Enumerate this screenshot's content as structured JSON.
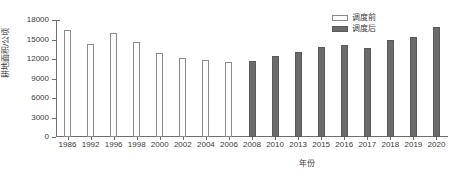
{
  "chart_data": {
    "type": "bar",
    "title": "",
    "xlabel": "年份",
    "ylabel": "耕地面积/公顷",
    "ylim": [
      0,
      18000
    ],
    "yticks": [
      0,
      3000,
      6000,
      9000,
      12000,
      15000,
      18000
    ],
    "ytick_labels": [
      "0",
      "3000",
      "6000",
      "9000",
      "12000",
      "15000",
      "18000"
    ],
    "grid": false,
    "legend_position": "top-right",
    "categories": [
      "1986",
      "1992",
      "1996",
      "1998",
      "2000",
      "2002",
      "2004",
      "2006",
      "2008",
      "2010",
      "2013",
      "2015",
      "2016",
      "2017",
      "2018",
      "2019",
      "2020"
    ],
    "series": [
      {
        "name": "调度前",
        "color": "#fdfdfd",
        "edge_color": "#8a8a8a",
        "values": [
          16400,
          14300,
          16000,
          14600,
          13000,
          12100,
          11900,
          11500,
          null,
          null,
          null,
          null,
          null,
          null,
          null,
          null,
          null
        ]
      },
      {
        "name": "调度后",
        "color": "#6b6b6b",
        "edge_color": "#5a5a5a",
        "values": [
          null,
          null,
          null,
          null,
          null,
          null,
          null,
          null,
          11700,
          12500,
          13100,
          13900,
          14200,
          13700,
          15000,
          15400,
          16900
        ]
      }
    ]
  },
  "legend": {
    "items": [
      {
        "label": "调度前",
        "swatch": "before"
      },
      {
        "label": "调度后",
        "swatch": "after"
      }
    ]
  }
}
